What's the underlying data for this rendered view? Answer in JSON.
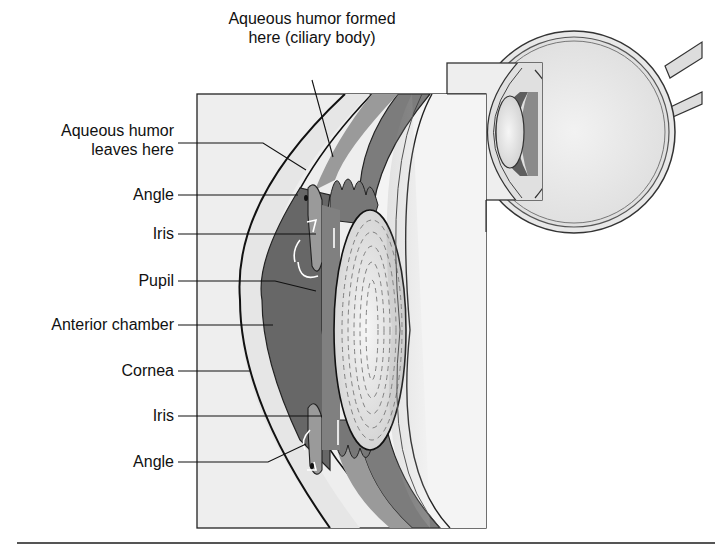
{
  "diagram": {
    "labels": {
      "top": {
        "line1": "Aqueous humor formed",
        "line2": "here (ciliary body)"
      },
      "leaves": {
        "line1": "Aqueous humor",
        "line2": "leaves here"
      },
      "angle_top": "Angle",
      "iris_top": "Iris",
      "pupil": "Pupil",
      "anterior_chamber": "Anterior chamber",
      "cornea": "Cornea",
      "iris_bottom": "Iris",
      "angle_bottom": "Angle"
    },
    "colors": {
      "background": "#ffffff",
      "box_fill": "#eeeeee",
      "cornea": "#e4e4e4",
      "chamber": "#6a6a6a",
      "iris": "#8e8e8e",
      "ciliary": "#a8a8a8",
      "lens": "#e2e2e2",
      "outline": "#1a1a1a",
      "rule": "#555555"
    }
  }
}
